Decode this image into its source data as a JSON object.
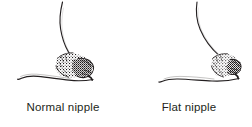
{
  "illustration": {
    "title": "Nipple types side-view comparison",
    "background_color": "#ffffff",
    "ink_color": "#231f20",
    "caption_color": "#231f20",
    "panel_count": 2
  },
  "panels": [
    {
      "id": "normal",
      "caption": "Normal nipple",
      "nipple_icon_name": "protruding-nipple-illustration",
      "description": "Side-view breast profile with everted, protruding nipple"
    },
    {
      "id": "flat",
      "caption": "Flat nipple",
      "nipple_icon_name": "flat-nipple-illustration",
      "description": "Side-view breast profile with flattened, non-protruding nipple"
    }
  ]
}
